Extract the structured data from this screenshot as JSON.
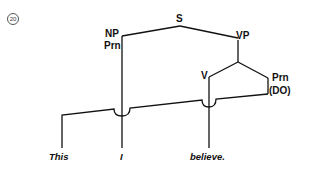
{
  "example_number": "20",
  "tree": {
    "root": "S",
    "subject_node": "NP",
    "subject_category": "Prn",
    "predicate_node": "VP",
    "verb_node": "V",
    "object_category": "Prn",
    "object_function": "(DO)"
  },
  "words": [
    "This",
    "I",
    "believe."
  ],
  "colors": {
    "line": "#111111",
    "background": "#ffffff"
  }
}
